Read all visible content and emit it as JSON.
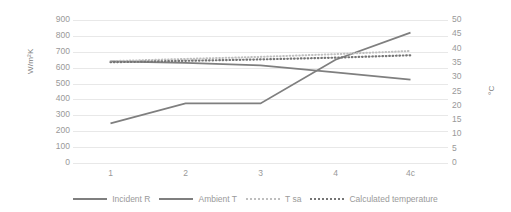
{
  "chart_data": {
    "type": "line",
    "title": "",
    "xlabel": "",
    "ylabel": "W/m²K",
    "y2label": "°C",
    "categories": [
      "1",
      "2",
      "3",
      "4",
      "4c"
    ],
    "ylim": [
      0,
      900
    ],
    "y2lim": [
      0,
      50
    ],
    "yticks": [
      900,
      800,
      700,
      600,
      500,
      400,
      300,
      200,
      100,
      0
    ],
    "y2ticks": [
      50,
      45,
      40,
      35,
      30,
      25,
      20,
      15,
      10,
      5,
      0
    ],
    "grid": true,
    "legend_position": "bottom",
    "series": [
      {
        "name": "Incident R",
        "axis": "left",
        "style": "solid",
        "color": "#7f7f7f",
        "values": [
          250,
          375,
          375,
          650,
          820
        ]
      },
      {
        "name": "Ambient T",
        "axis": "left",
        "style": "solid",
        "color": "#7f7f7f",
        "values": [
          640,
          630,
          615,
          570,
          525
        ]
      },
      {
        "name": "T sa",
        "axis": "left",
        "style": "dotted-light",
        "color": "#bfbfbf",
        "values": [
          641,
          655,
          668,
          685,
          705
        ]
      },
      {
        "name": "Calculated temperature",
        "axis": "left",
        "style": "dotted-dark",
        "color": "#757575",
        "values": [
          634,
          643,
          652,
          663,
          678
        ]
      }
    ]
  },
  "legend": {
    "items": [
      {
        "label": "Incident R"
      },
      {
        "label": "Ambient T"
      },
      {
        "label": "T sa"
      },
      {
        "label": "Calculated temperature"
      }
    ]
  }
}
